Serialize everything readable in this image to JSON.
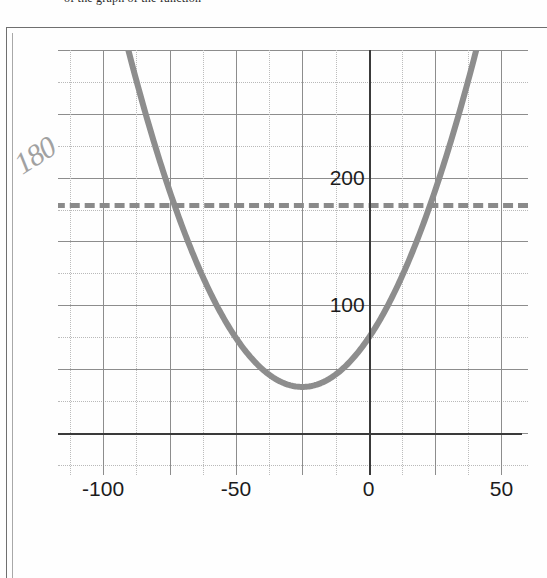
{
  "document": {
    "cut_header_text": "of the graph of the function",
    "border_color": "#6f6f6f"
  },
  "annotation": {
    "handwritten_value": "180",
    "color": "#9a9a9a"
  },
  "chart_data": {
    "type": "line",
    "title": "",
    "subtitle": "",
    "xlabel": "",
    "ylabel": "",
    "xlim": [
      -117,
      60
    ],
    "ylim": [
      -33,
      300
    ],
    "grid": true,
    "legend": false,
    "x_ticks": [
      -100,
      -50,
      0,
      50
    ],
    "x_tick_labels": [
      "-100",
      "-50",
      "0",
      "50"
    ],
    "y_ticks": [
      100,
      200
    ],
    "y_tick_labels": [
      "100",
      "200"
    ],
    "minor_grid_step_x": 12.5,
    "minor_grid_step_y": 25,
    "major_grid_step_x": 25,
    "major_grid_step_y": 50,
    "series": [
      {
        "name": "parabola",
        "type": "parabola",
        "color": "#8d8d8d",
        "linewidth": 6,
        "vertex": [
          -25,
          36
        ],
        "a": 0.0615,
        "roots": [
          -49.2,
          -0.8
        ],
        "points": [
          [
            -92,
            254
          ],
          [
            -85,
            228
          ],
          [
            -80,
            206
          ],
          [
            -75,
            190
          ],
          [
            -70,
            160
          ],
          [
            -60,
            113
          ],
          [
            -50,
            75
          ],
          [
            -40,
            50
          ],
          [
            -30,
            37
          ],
          [
            -25,
            36
          ],
          [
            -20,
            38
          ],
          [
            -10,
            50
          ],
          [
            0,
            75
          ],
          [
            10,
            113
          ],
          [
            20,
            163
          ],
          [
            25,
            200
          ],
          [
            30,
            250
          ],
          [
            35,
            300
          ]
        ]
      },
      {
        "name": "threshold",
        "type": "hline",
        "value": 180,
        "color": "#8a8a8a",
        "linestyle": "dashed",
        "linewidth": 5
      }
    ]
  }
}
